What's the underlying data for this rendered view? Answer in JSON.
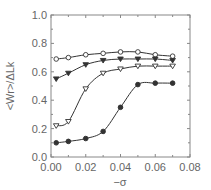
{
  "chart_data": {
    "type": "line",
    "title": "",
    "xlabel": "−σ",
    "ylabel": "<Wr>/ΔLk",
    "xlim": [
      0.0,
      0.08
    ],
    "ylim": [
      0.0,
      1.0
    ],
    "x_ticks": [
      "0.00",
      "0.02",
      "0.04",
      "0.06",
      "0.08"
    ],
    "y_ticks": [
      "0.0",
      "0.2",
      "0.4",
      "0.6",
      "0.8",
      "1.0"
    ],
    "grid": false,
    "legend": null,
    "x": [
      0.003,
      0.01,
      0.02,
      0.03,
      0.04,
      0.05,
      0.06,
      0.07
    ],
    "series": [
      {
        "name": "open-circle",
        "marker": "circle-open",
        "values": [
          0.69,
          0.7,
          0.72,
          0.73,
          0.74,
          0.74,
          0.72,
          0.71
        ]
      },
      {
        "name": "filled-triangle-down",
        "marker": "triangle-down-filled",
        "values": [
          0.55,
          0.59,
          0.65,
          0.68,
          0.69,
          0.69,
          0.69,
          0.68
        ]
      },
      {
        "name": "open-triangle-down",
        "marker": "triangle-down-open",
        "values": [
          0.22,
          0.25,
          0.48,
          0.59,
          0.62,
          0.64,
          0.64,
          0.64
        ]
      },
      {
        "name": "filled-circle",
        "marker": "circle-filled",
        "values": [
          0.1,
          0.11,
          0.13,
          0.18,
          0.35,
          0.51,
          0.52,
          0.52
        ]
      }
    ]
  },
  "colors": {
    "axis": "#888888",
    "line": "#333333",
    "marker": "#333333"
  }
}
